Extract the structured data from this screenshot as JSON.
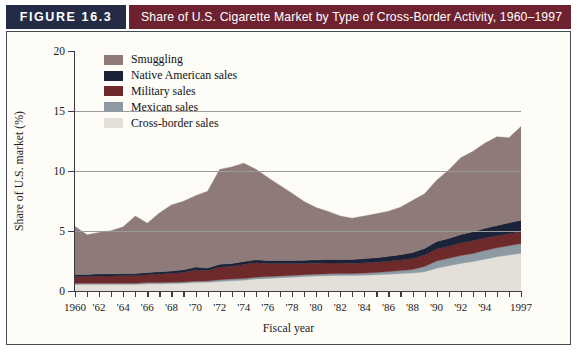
{
  "figure": {
    "tag": "FIGURE 16.3",
    "title": "Share of U.S. Cigarette Market by Type of Cross-Border Activity, 1960–1997",
    "tag_bg": "#232c44",
    "title_bg": "#6e2230"
  },
  "chart_data": {
    "type": "area",
    "stacked": true,
    "title": "Share of U.S. Cigarette Market by Type of Cross-Border Activity, 1960–1997",
    "xlabel": "Fiscal year",
    "ylabel": "Share of U.S. market (%)",
    "xlim": [
      1960,
      1997
    ],
    "ylim": [
      0,
      20
    ],
    "yticks": [
      0,
      5,
      10,
      15,
      20
    ],
    "ytick_labels": [
      "0",
      "5",
      "10",
      "15",
      "20"
    ],
    "xticks": [
      1960,
      1961,
      1962,
      1963,
      1964,
      1965,
      1966,
      1967,
      1968,
      1969,
      1970,
      1971,
      1972,
      1973,
      1974,
      1975,
      1976,
      1977,
      1978,
      1979,
      1980,
      1981,
      1982,
      1983,
      1984,
      1985,
      1986,
      1987,
      1988,
      1989,
      1990,
      1991,
      1992,
      1993,
      1994,
      1995,
      1996,
      1997
    ],
    "xtick_labels": [
      "1960",
      "",
      "'62",
      "",
      "'64",
      "",
      "'66",
      "",
      "'68",
      "",
      "'70",
      "",
      "'72",
      "",
      "'74",
      "",
      "'76",
      "",
      "'78",
      "",
      "'80",
      "",
      "'82",
      "",
      "'84",
      "",
      "'86",
      "",
      "'88",
      "",
      "'90",
      "",
      "'92",
      "",
      "'94",
      "",
      "",
      "1997"
    ],
    "grid": "horizontal",
    "gridlines": [
      5,
      10,
      15
    ],
    "legend_position": "upper-left",
    "x": [
      1960,
      1961,
      1962,
      1963,
      1964,
      1965,
      1966,
      1967,
      1968,
      1969,
      1970,
      1971,
      1972,
      1973,
      1974,
      1975,
      1976,
      1977,
      1978,
      1979,
      1980,
      1981,
      1982,
      1983,
      1984,
      1985,
      1986,
      1987,
      1988,
      1989,
      1990,
      1991,
      1992,
      1993,
      1994,
      1995,
      1996,
      1997
    ],
    "series": [
      {
        "name": "Cross-border sales",
        "color": "#e3e0da",
        "values": [
          0.55,
          0.55,
          0.55,
          0.55,
          0.55,
          0.55,
          0.6,
          0.6,
          0.62,
          0.65,
          0.7,
          0.72,
          0.8,
          0.85,
          0.9,
          1.0,
          1.05,
          1.1,
          1.15,
          1.2,
          1.25,
          1.28,
          1.3,
          1.3,
          1.32,
          1.35,
          1.4,
          1.45,
          1.5,
          1.6,
          1.9,
          2.1,
          2.3,
          2.45,
          2.65,
          2.85,
          3.0,
          3.15
        ]
      },
      {
        "name": "Mexican sales",
        "color": "#8e9aa3",
        "values": [
          0.1,
          0.1,
          0.1,
          0.1,
          0.1,
          0.1,
          0.1,
          0.1,
          0.1,
          0.1,
          0.12,
          0.12,
          0.14,
          0.15,
          0.15,
          0.15,
          0.15,
          0.15,
          0.15,
          0.15,
          0.15,
          0.15,
          0.15,
          0.15,
          0.18,
          0.2,
          0.22,
          0.25,
          0.3,
          0.45,
          0.6,
          0.62,
          0.65,
          0.68,
          0.72,
          0.75,
          0.78,
          0.8
        ]
      },
      {
        "name": "Military sales",
        "color": "#6e2a2a",
        "values": [
          0.55,
          0.55,
          0.6,
          0.6,
          0.62,
          0.62,
          0.65,
          0.7,
          0.75,
          0.8,
          0.95,
          0.85,
          1.05,
          1.05,
          1.15,
          1.2,
          1.1,
          1.05,
          1.0,
          0.95,
          0.92,
          0.9,
          0.88,
          0.85,
          0.85,
          0.85,
          0.85,
          0.88,
          0.9,
          0.95,
          1.0,
          1.0,
          1.05,
          1.05,
          1.05,
          1.0,
          1.0,
          1.0
        ]
      },
      {
        "name": "Native American sales",
        "color": "#1c2338",
        "values": [
          0.18,
          0.18,
          0.18,
          0.18,
          0.18,
          0.18,
          0.2,
          0.2,
          0.2,
          0.22,
          0.22,
          0.22,
          0.24,
          0.24,
          0.25,
          0.25,
          0.25,
          0.25,
          0.25,
          0.26,
          0.28,
          0.3,
          0.3,
          0.32,
          0.35,
          0.38,
          0.42,
          0.45,
          0.5,
          0.55,
          0.62,
          0.66,
          0.7,
          0.75,
          0.8,
          0.85,
          0.9,
          0.95
        ]
      },
      {
        "name": "Smuggling",
        "color": "#8e7a79",
        "values": [
          4.0,
          3.3,
          3.45,
          3.6,
          3.9,
          4.8,
          4.1,
          4.9,
          5.5,
          5.7,
          5.95,
          6.4,
          7.9,
          8.05,
          8.2,
          7.55,
          6.9,
          6.25,
          5.6,
          4.9,
          4.35,
          4.0,
          3.62,
          3.45,
          3.55,
          3.65,
          3.75,
          3.95,
          4.35,
          4.55,
          5.1,
          5.7,
          6.4,
          6.7,
          7.1,
          7.4,
          7.1,
          7.8
        ]
      }
    ],
    "totals": [
      5.38,
      4.68,
      4.88,
      5.03,
      5.35,
      6.25,
      5.65,
      6.5,
      7.17,
      7.47,
      7.94,
      8.31,
      10.13,
      10.34,
      10.65,
      10.15,
      9.45,
      8.8,
      8.15,
      7.46,
      6.95,
      6.63,
      6.25,
      6.07,
      6.25,
      6.43,
      6.64,
      6.98,
      7.55,
      8.1,
      9.22,
      10.08,
      11.1,
      11.63,
      12.32,
      12.85,
      12.78,
      13.7
    ]
  },
  "legend": {
    "items": [
      {
        "label": "Smuggling",
        "color": "#8e7a79"
      },
      {
        "label": "Native American sales",
        "color": "#1c2338"
      },
      {
        "label": "Military sales",
        "color": "#6e2a2a"
      },
      {
        "label": "Mexican sales",
        "color": "#8e9aa3"
      },
      {
        "label": "Cross-border sales",
        "color": "#e3e0da"
      }
    ]
  }
}
